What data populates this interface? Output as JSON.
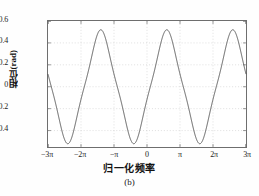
{
  "figure": {
    "caption": "(b)",
    "background_color": "#ffffff"
  },
  "chart_data": {
    "type": "line",
    "title": "",
    "subtitle": "",
    "caption": "(b)",
    "xlabel": "归一化频率",
    "ylabel": "相位(rad)",
    "xlim": [
      -9.42477796,
      9.42477796
    ],
    "ylim": [
      -0.55,
      0.6
    ],
    "grid": true,
    "grid_style": "dotted",
    "grid_color": "#c8c8c8",
    "legend": null,
    "line_color": "#4a4a4a",
    "line_width": 0.9,
    "xticks": [
      -9.42477796,
      -6.28318531,
      -3.14159265,
      0,
      3.14159265,
      6.28318531,
      9.42477796
    ],
    "xticklabels": [
      "−3π",
      "−2π",
      "−π",
      "0",
      "π",
      "2π",
      "3π"
    ],
    "yticks": [
      -0.4,
      -0.2,
      0,
      0.2,
      0.4,
      0.6
    ],
    "yticklabels": [
      "−0.4",
      "−0.2",
      "0",
      "0.2",
      "0.4",
      "0.6"
    ],
    "series": [
      {
        "name": "phase",
        "description": "periodic phase ripple, period 2π, amplitude ≈0.52 rad",
        "amplitude": 0.52,
        "period": 6.28318531,
        "phase_offset_x": 1.885,
        "peaks_x": [
          -4.39822972,
          1.88495559,
          8.16814089
        ],
        "peaks_y": [
          0.52,
          0.52,
          0.52
        ],
        "troughs_x": [
          -7.53982237,
          -1.25663706,
          5.02654825
        ],
        "troughs_y": [
          -0.52,
          -0.52,
          -0.52
        ],
        "x": [
          -9.4248,
          -9.1106,
          -8.7965,
          -8.4823,
          -8.1681,
          -7.854,
          -7.5398,
          -7.2257,
          -6.9115,
          -6.5973,
          -6.2832,
          -5.969,
          -5.6549,
          -5.3407,
          -5.0265,
          -4.7124,
          -4.3982,
          -4.0841,
          -3.7699,
          -3.4558,
          -3.1416,
          -2.8274,
          -2.5133,
          -2.1991,
          -1.885,
          -1.5708,
          -1.2566,
          -0.9425,
          -0.6283,
          -0.3142,
          0,
          0.3142,
          0.6283,
          0.9425,
          1.2566,
          1.5708,
          1.885,
          2.1991,
          2.5133,
          2.8274,
          3.1416,
          3.4558,
          3.7699,
          4.0841,
          4.3982,
          4.7124,
          5.0265,
          5.3407,
          5.6549,
          5.969,
          6.2832,
          6.5973,
          6.9115,
          7.2257,
          7.5398,
          7.854,
          8.1681,
          8.4823,
          8.7965,
          9.1106,
          9.4248
        ],
        "y": [
          0.0,
          -0.35,
          -0.49,
          -0.52,
          -0.52,
          -0.52,
          -0.51,
          -0.45,
          -0.36,
          -0.25,
          -0.13,
          -0.01,
          0.12,
          0.25,
          0.36,
          0.45,
          0.51,
          0.52,
          0.52,
          0.45,
          0.2,
          -0.2,
          -0.45,
          -0.52,
          -0.52,
          -0.52,
          -0.51,
          -0.45,
          -0.36,
          -0.25,
          -0.13,
          0.0,
          0.13,
          0.25,
          0.36,
          0.45,
          0.52,
          0.52,
          0.51,
          0.45,
          0.2,
          -0.2,
          -0.45,
          -0.52,
          -0.52,
          -0.52,
          -0.51,
          -0.45,
          -0.36,
          -0.25,
          -0.13,
          0.0,
          0.13,
          0.25,
          0.36,
          0.45,
          0.52,
          0.52,
          0.51,
          0.45,
          0.2
        ]
      }
    ]
  }
}
